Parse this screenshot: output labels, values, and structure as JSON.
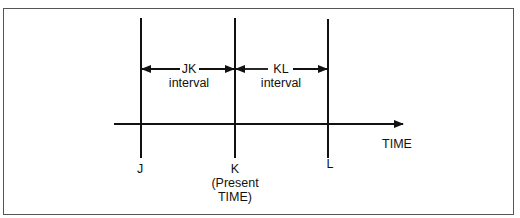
{
  "diagram": {
    "type": "timeline",
    "axis_label": "TIME",
    "points": [
      {
        "id": "J",
        "label": "J",
        "sublabel": ""
      },
      {
        "id": "K",
        "label": "K",
        "sublabel": "(Present\nTIME)"
      },
      {
        "id": "L",
        "label": "L",
        "sublabel": ""
      }
    ],
    "intervals": [
      {
        "id": "JK",
        "line1": "JK",
        "line2": "interval",
        "from": "J",
        "to": "K"
      },
      {
        "id": "KL",
        "line1": "KL",
        "line2": "interval",
        "from": "K",
        "to": "L"
      }
    ],
    "labels": {
      "j": "J",
      "k": "K",
      "k_sub1": "(Present",
      "k_sub2": "TIME)",
      "l": "L",
      "time": "TIME",
      "jk_1": "JK",
      "jk_2": "interval",
      "kl_1": "KL",
      "kl_2": "interval"
    },
    "colors": {
      "line": "#111111",
      "border": "#555555",
      "background": "#ffffff"
    }
  }
}
